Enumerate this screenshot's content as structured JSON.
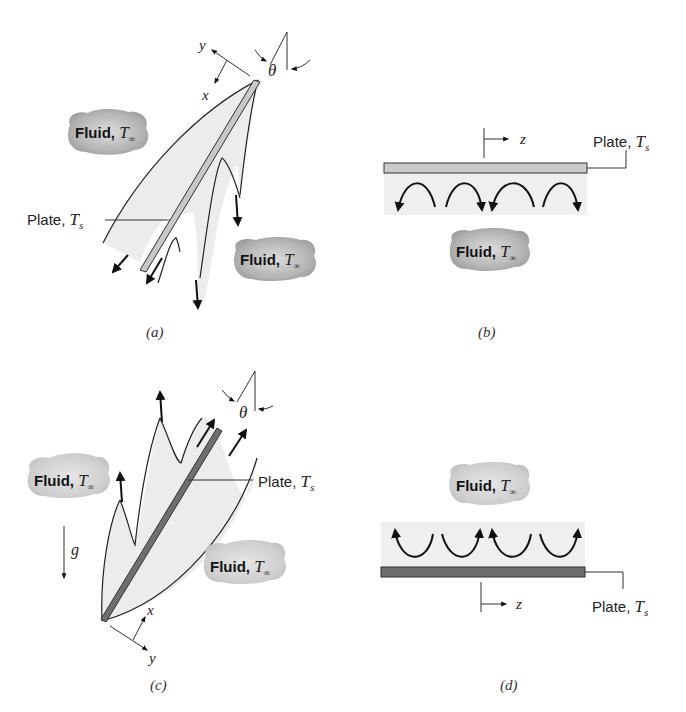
{
  "figure": {
    "panels": [
      {
        "id": "a",
        "caption": "(a)",
        "plate_label": "Plate, ",
        "plate_symbol": "T",
        "plate_sub": "s",
        "fluid_labels": [
          {
            "text": "Fluid, ",
            "symbol": "T",
            "sub": "∞"
          },
          {
            "text": "Fluid, ",
            "symbol": "T",
            "sub": "∞"
          }
        ],
        "axes": {
          "x": "x",
          "y": "y"
        },
        "angle": "θ"
      },
      {
        "id": "b",
        "caption": "(b)",
        "plate_label": "Plate, ",
        "plate_symbol": "T",
        "plate_sub": "s",
        "fluid_labels": [
          {
            "text": "Fluid, ",
            "symbol": "T",
            "sub": "∞"
          }
        ],
        "axes": {
          "z": "z"
        }
      },
      {
        "id": "c",
        "caption": "(c)",
        "plate_label": "Plate, ",
        "plate_symbol": "T",
        "plate_sub": "s",
        "fluid_labels": [
          {
            "text": "Fluid, ",
            "symbol": "T",
            "sub": "∞"
          },
          {
            "text": "Fluid, ",
            "symbol": "T",
            "sub": "∞"
          }
        ],
        "axes": {
          "x": "x",
          "y": "y"
        },
        "angle": "θ",
        "gravity": "g"
      },
      {
        "id": "d",
        "caption": "(d)",
        "plate_label": "Plate, ",
        "plate_symbol": "T",
        "plate_sub": "s",
        "fluid_labels": [
          {
            "text": "Fluid, ",
            "symbol": "T",
            "sub": "∞"
          }
        ],
        "axes": {
          "z": "z"
        }
      }
    ],
    "colors": {
      "cold_plate": "#c8c8c8",
      "hot_plate": "#6e6e6e",
      "boundary_layer": "#ececec",
      "cloud": "#b9b9b9"
    }
  }
}
